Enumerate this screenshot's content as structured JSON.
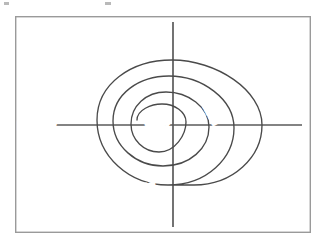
{
  "diagram": {
    "type": "spiral-model",
    "frame": {
      "x": 15,
      "y": 16,
      "width": 296,
      "height": 217,
      "border_color": "#9a9a9a"
    },
    "center": {
      "x": 173,
      "y": 125
    },
    "axes": {
      "horizontal": {
        "x1": 22,
        "y1": 125,
        "x2": 302,
        "y2": 125,
        "color": "#5a5a5a"
      },
      "vertical": {
        "x1": 173,
        "y1": 22,
        "x2": 173,
        "y2": 227,
        "color": "#5a5a5a"
      }
    },
    "spiral": {
      "turns": 3,
      "stroke_color": "#4a4a4a",
      "start_point": {
        "x": 137,
        "y": 120
      },
      "end_point": {
        "x": 173,
        "y": 185
      },
      "left_crossings": [
        133,
        113,
        97
      ],
      "right_crossings": [
        212,
        235,
        262
      ],
      "top_crossings": [
        94,
        78,
        62
      ],
      "bottom_crossings": [
        152,
        166,
        185
      ]
    },
    "quadrant_labels": [
      {
        "id": "commit",
        "text": "Commit",
        "x": 65,
        "y": 76,
        "anchor": "start",
        "quadrant": "upper-left"
      },
      {
        "id": "evaluate-risks",
        "text": "Evaluate Risks",
        "x": 231,
        "y": 73,
        "anchor": "start",
        "quadrant": "upper-right"
      },
      {
        "id": "review",
        "text": "Review",
        "x": 18,
        "y": 130,
        "anchor": "start",
        "quadrant": "left-axis"
      },
      {
        "id": "plan-next",
        "text": "Plan Next",
        "x": 105,
        "y": 190,
        "anchor": "start",
        "quadrant": "lower-left"
      },
      {
        "id": "develop-construct",
        "text": "Develop/Construct",
        "x": 203,
        "y": 196,
        "anchor": "start",
        "quadrant": "lower-right"
      }
    ],
    "center_label": {
      "id": "start",
      "text": "Start",
      "x": 145,
      "y": 125
    },
    "iteration_labels": [
      {
        "id": "iteration-1",
        "text": "Iteration",
        "x": 196,
        "y": 92,
        "rotation": 62
      },
      {
        "id": "iteration-2",
        "text": "Iteration",
        "x": 225,
        "y": 86,
        "rotation": 62
      },
      {
        "id": "iteration-3",
        "text": "Iteration",
        "x": 254,
        "y": 80,
        "rotation": 62
      }
    ],
    "colors": {
      "background": "#ffffff",
      "frame_border": "#9a9a9a",
      "axis": "#5a5a5a",
      "spiral": "#4a4a4a",
      "text": "#232323"
    }
  }
}
